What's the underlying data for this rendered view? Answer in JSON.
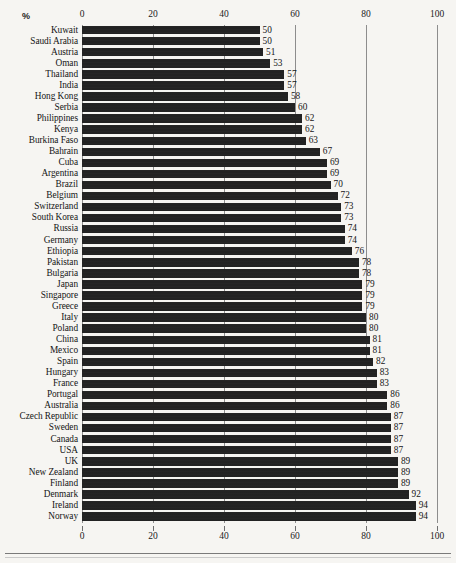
{
  "chart_data": {
    "type": "bar",
    "orientation": "horizontal",
    "title": "",
    "xlabel": "%",
    "ylabel": "",
    "xlim": [
      0,
      100
    ],
    "xticks": [
      0,
      20,
      40,
      60,
      80,
      100
    ],
    "grid": true,
    "gridlines_at": [
      0,
      20,
      40,
      60,
      80,
      100
    ],
    "legend": "none",
    "bar_color": "#1d1d1d",
    "background_color": "#f6f5f2",
    "value_labels_shown": true,
    "sorted": "ascending",
    "categories": [
      "Kuwait",
      "Saudi Arabia",
      "Austria",
      "Oman",
      "Thailand",
      "India",
      "Hong Kong",
      "Serbia",
      "Philippines",
      "Kenya",
      "Burkina Faso",
      "Bahrain",
      "Cuba",
      "Argentina",
      "Brazil",
      "Belgium",
      "Switzerland",
      "South Korea",
      "Russia",
      "Germany",
      "Ethiopia",
      "Pakistan",
      "Bulgaria",
      "Japan",
      "Singapore",
      "Greece",
      "Italy",
      "Poland",
      "China",
      "Mexico",
      "Spain",
      "Hungary",
      "France",
      "Portugal",
      "Australia",
      "Czech Republic",
      "Sweden",
      "Canada",
      "USA",
      "UK",
      "New Zealand",
      "Finland",
      "Denmark",
      "Ireland",
      "Norway"
    ],
    "values": [
      50,
      50,
      51,
      53,
      57,
      57,
      58,
      60,
      62,
      62,
      63,
      67,
      69,
      69,
      70,
      72,
      73,
      73,
      74,
      74,
      76,
      78,
      78,
      79,
      79,
      79,
      80,
      80,
      81,
      81,
      82,
      83,
      83,
      86,
      86,
      87,
      87,
      87,
      87,
      89,
      89,
      89,
      92,
      94,
      94
    ]
  },
  "axis": {
    "unit_label": "%",
    "tick_labels": [
      "0",
      "20",
      "40",
      "60",
      "80",
      "100"
    ]
  }
}
